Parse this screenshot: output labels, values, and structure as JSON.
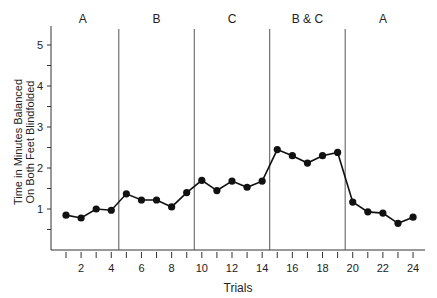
{
  "chart_data": {
    "type": "line",
    "title": "",
    "xlabel": "Trials",
    "ylabel_lines": [
      "Time in Minutes Balanced",
      "On Both Feet Blindfolded"
    ],
    "ylim": [
      0,
      5.3
    ],
    "xlim": [
      0,
      25
    ],
    "y_ticks": [
      1,
      2,
      3,
      4,
      5
    ],
    "x_tick_labels": [
      2,
      4,
      6,
      8,
      10,
      12,
      14,
      16,
      18,
      20,
      22,
      24
    ],
    "grid": false,
    "phases": [
      {
        "label": "A",
        "start": 0.5,
        "end": 4.5
      },
      {
        "label": "B",
        "start": 4.5,
        "end": 9.5
      },
      {
        "label": "C",
        "start": 9.5,
        "end": 14.5
      },
      {
        "label": "B & C",
        "start": 14.5,
        "end": 19.5
      },
      {
        "label": "A",
        "start": 19.5,
        "end": 24.5
      }
    ],
    "x": [
      1,
      2,
      3,
      4,
      5,
      6,
      7,
      8,
      9,
      10,
      11,
      12,
      13,
      14,
      15,
      16,
      17,
      18,
      19,
      20,
      21,
      22,
      23,
      24
    ],
    "series": [
      {
        "name": "Balance time",
        "values": [
          0.85,
          0.78,
          1.0,
          0.97,
          1.37,
          1.22,
          1.22,
          1.05,
          1.4,
          1.7,
          1.45,
          1.68,
          1.53,
          1.68,
          2.45,
          2.3,
          2.12,
          2.3,
          2.38,
          1.17,
          0.93,
          0.9,
          0.65,
          0.8
        ]
      }
    ]
  }
}
